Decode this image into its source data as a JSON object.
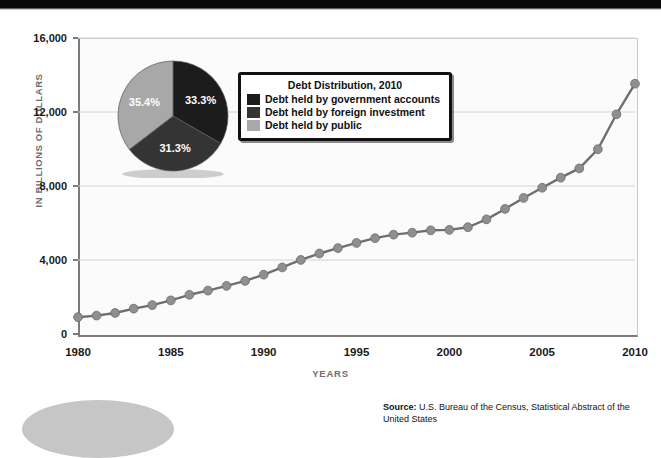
{
  "chart_data": {
    "type": "line",
    "title": "",
    "xlabel": "YEARS",
    "ylabel": "IN BILLIONS OF DOLLARS",
    "xlim": [
      1980,
      2010
    ],
    "ylim": [
      0,
      16000
    ],
    "grid": true,
    "x_ticks": [
      "1980",
      "1985",
      "1990",
      "1995",
      "2000",
      "2005",
      "2010"
    ],
    "y_ticks": [
      "0",
      "4,000",
      "8,000",
      "12,000",
      "16,000"
    ],
    "series": [
      {
        "name": "Gross federal debt",
        "x": [
          1980,
          1981,
          1982,
          1983,
          1984,
          1985,
          1986,
          1987,
          1988,
          1989,
          1990,
          1991,
          1992,
          1993,
          1994,
          1995,
          1996,
          1997,
          1998,
          1999,
          2000,
          2001,
          2002,
          2003,
          2004,
          2005,
          2006,
          2007,
          2008,
          2009,
          2010
        ],
        "values": [
          909,
          994,
          1137,
          1371,
          1564,
          1817,
          2120,
          2346,
          2601,
          2868,
          3206,
          3598,
          4002,
          4351,
          4643,
          4921,
          5181,
          5369,
          5478,
          5606,
          5629,
          5770,
          6198,
          6760,
          7355,
          7905,
          8451,
          8951,
          9986,
          11876,
          13529
        ]
      }
    ]
  },
  "pie_chart": {
    "title": "Debt Distribution, 2010",
    "slices": [
      {
        "label": "Debt held by government accounts",
        "value": 33.3,
        "display": "33.3%",
        "color": "#1c1c1c"
      },
      {
        "label": "Debt held by foreign investment",
        "value": 31.3,
        "display": "31.3%",
        "color": "#343434"
      },
      {
        "label": "Debt held by public",
        "value": 35.4,
        "display": "35.4%",
        "color": "#a8a8a8"
      }
    ]
  },
  "source": {
    "label": "Source:",
    "text": "U.S. Bureau of the Census, Statistical Abstract of the United States"
  },
  "colors": {
    "line": "#6e6e6e",
    "marker": "#8f8f8f",
    "axis": "#7b7b7b",
    "grid": "#d2d2d2"
  }
}
